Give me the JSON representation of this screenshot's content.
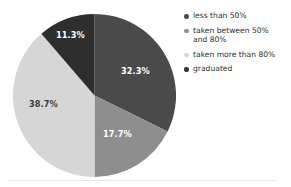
{
  "chart_data": {
    "type": "pie",
    "title": "",
    "subtitle": "",
    "xlabel": "",
    "ylabel": "",
    "grid": false,
    "legend_position": "right",
    "start_angle_deg": 0,
    "direction": "clockwise",
    "categories": [
      "less than 50%",
      "taken between 50% and 80%",
      "taken more than 80%",
      "graduated"
    ],
    "values": [
      32.3,
      17.7,
      38.7,
      11.3
    ],
    "value_unit": "%",
    "data_labels": [
      "32.3%",
      "17.7%",
      "38.7%",
      "11.3%"
    ],
    "colors": [
      "#4a4a4a",
      "#8e8e8e",
      "#d6d6d6",
      "#2e2e2e"
    ],
    "label_text_colors": [
      "#ffffff",
      "#ffffff",
      "#3b3b3b",
      "#ffffff"
    ],
    "slices": [
      {
        "name": "less than 50%",
        "value": 32.3,
        "label": "32.3%",
        "color": "#4a4a4a",
        "label_on": "dark",
        "label_x": 121,
        "label_y": 68
      },
      {
        "name": "taken between 50% and 80%",
        "value": 17.7,
        "label": "17.7%",
        "color": "#8e8e8e",
        "label_on": "dark",
        "label_x": 103,
        "label_y": 131
      },
      {
        "name": "taken more than 80%",
        "value": 38.7,
        "label": "38.7%",
        "color": "#d6d6d6",
        "label_on": "light",
        "label_x": 29,
        "label_y": 101
      },
      {
        "name": "graduated",
        "value": 11.3,
        "label": "11.3%",
        "color": "#2e2e2e",
        "label_on": "dark",
        "label_x": 56,
        "label_y": 32
      }
    ]
  },
  "legend": {
    "items": [
      {
        "label": "less than 50%",
        "color": "#4a4a4a"
      },
      {
        "label": "taken between 50%\nand 80%",
        "color": "#8e8e8e"
      },
      {
        "label": "taken more than 80%",
        "color": "#d6d6d6"
      },
      {
        "label": "graduated",
        "color": "#2e2e2e"
      }
    ]
  }
}
